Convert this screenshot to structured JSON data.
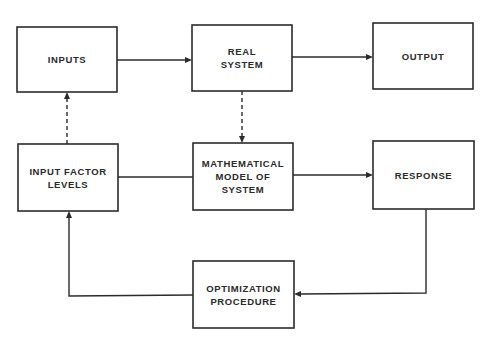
{
  "diagram": {
    "type": "block-flow-diagram",
    "nodes": [
      {
        "id": "inputs",
        "label": "INPUTS",
        "x": 17,
        "y": 27,
        "w": 100,
        "h": 65
      },
      {
        "id": "real_system",
        "label": "REAL\nSYSTEM",
        "x": 192,
        "y": 25,
        "w": 100,
        "h": 66
      },
      {
        "id": "output",
        "label": "OUTPUT",
        "x": 373,
        "y": 23,
        "w": 100,
        "h": 66
      },
      {
        "id": "input_factor_levels",
        "label": "INPUT FACTOR\nLEVELS",
        "x": 18,
        "y": 144,
        "w": 100,
        "h": 67
      },
      {
        "id": "mathematical_model",
        "label": "MATHEMATICAL\nMODEL OF\nSYSTEM",
        "x": 193,
        "y": 143,
        "w": 100,
        "h": 67
      },
      {
        "id": "response",
        "label": "RESPONSE",
        "x": 373,
        "y": 141,
        "w": 101,
        "h": 68
      },
      {
        "id": "optimization_procedure",
        "label": "OPTIMIZATION\nPROCEDURE",
        "x": 193,
        "y": 261,
        "w": 101,
        "h": 67
      }
    ],
    "edges": [
      {
        "from": "inputs",
        "to": "real_system",
        "style": "solid",
        "arrow": true
      },
      {
        "from": "real_system",
        "to": "output",
        "style": "solid",
        "arrow": true
      },
      {
        "from": "input_factor_levels",
        "to": "inputs",
        "style": "dashed",
        "arrow": true
      },
      {
        "from": "real_system",
        "to": "mathematical_model",
        "style": "dashed",
        "arrow": true
      },
      {
        "from": "input_factor_levels",
        "to": "mathematical_model",
        "style": "solid",
        "arrow": false
      },
      {
        "from": "mathematical_model",
        "to": "response",
        "style": "solid",
        "arrow": true
      },
      {
        "from": "response",
        "to": "optimization_procedure",
        "style": "solid",
        "arrow": true
      },
      {
        "from": "optimization_procedure",
        "to": "input_factor_levels",
        "style": "solid",
        "arrow": true
      }
    ]
  },
  "labels": {
    "inputs": "INPUTS",
    "real_system": "REAL\nSYSTEM",
    "output": "OUTPUT",
    "input_factor_levels": "INPUT FACTOR\nLEVELS",
    "mathematical_model": "MATHEMATICAL\nMODEL OF\nSYSTEM",
    "response": "RESPONSE",
    "optimization_procedure": "OPTIMIZATION\nPROCEDURE"
  },
  "colors": {
    "line": "#2b2b2b",
    "text": "#2a2a2a",
    "background": "#ffffff"
  }
}
